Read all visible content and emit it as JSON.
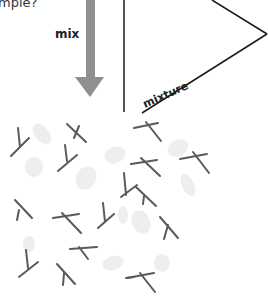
{
  "caption_fragment": "mple?",
  "arrow": {
    "label": "mix",
    "color": "#8f8f8f"
  },
  "triangle_label": "mixture",
  "colors": {
    "line": "#1a1a1a",
    "stick": "#5a5a5a",
    "blob": "#efefef"
  },
  "particles": {
    "sticks_count": 17,
    "blobs_count": 11
  }
}
